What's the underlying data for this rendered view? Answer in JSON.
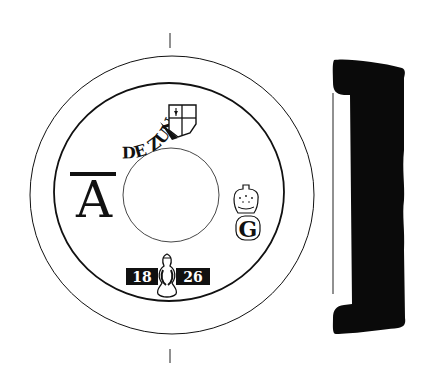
{
  "figure": {
    "type": "archaeological drawing of a ceramic disc with stamped marks, plan view and section profile",
    "colors": {
      "ink": "#111111",
      "background": "#ffffff"
    }
  },
  "plan_view": {
    "marks": {
      "monogram": "A",
      "monogram_style": "A with long serif top bar (T-like overhang)",
      "curved_inscription": "DE ZUN",
      "shield_mark": "quartered shield with arrow in upper-left quarter",
      "crown_letter": "G",
      "crown_mark": "crown above letter",
      "date_left": "18",
      "date_right": "26",
      "date_emblem": "flame/foliate emblem between date digits"
    },
    "axis_ticks": [
      "top-tick",
      "bottom-tick"
    ]
  },
  "section_profile": {
    "label": "cross-section profile (solid black)"
  }
}
